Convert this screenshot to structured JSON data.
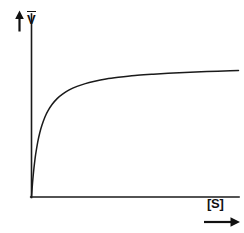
{
  "figure": {
    "title": "",
    "background_color": "#ffffff",
    "ink_color": "#1a1a1a",
    "y_axis_label": "V",
    "y_axis_label_has_overbar": true,
    "x_axis_label": "[S]",
    "y_axis_arrow_icon": "up-arrow-icon",
    "x_axis_arrow_icon": "right-arrow-icon"
  },
  "chart_data": {
    "type": "line",
    "title": "",
    "subtitle": "",
    "xlabel": "[S]",
    "ylabel": "V",
    "grid": false,
    "legend": false,
    "legend_position": "none",
    "axis_ticks": false,
    "tick_labels_x": [],
    "tick_labels_y": [],
    "xlim": [
      0,
      10
    ],
    "ylim": [
      0,
      1.12
    ],
    "annotations": [],
    "series": [
      {
        "name": "Michaelis-Menten saturation curve",
        "model": "v = Vmax * S / (Km + S)",
        "vmax": 1.0,
        "km": 0.42,
        "x": [
          0,
          0.05,
          0.1,
          0.15,
          0.2,
          0.3,
          0.4,
          0.5,
          0.65,
          0.8,
          1.0,
          1.25,
          1.5,
          1.8,
          2.2,
          2.6,
          3.0,
          3.6,
          4.2,
          5.0,
          5.8,
          6.6,
          7.4,
          8.2,
          9.0,
          9.6,
          10.0
        ],
        "y": [
          0.0,
          0.106,
          0.192,
          0.263,
          0.323,
          0.417,
          0.488,
          0.543,
          0.608,
          0.656,
          0.704,
          0.749,
          0.781,
          0.811,
          0.84,
          0.861,
          0.877,
          0.896,
          0.909,
          0.923,
          0.932,
          0.94,
          0.946,
          0.951,
          0.955,
          0.958,
          0.96
        ]
      }
    ]
  }
}
